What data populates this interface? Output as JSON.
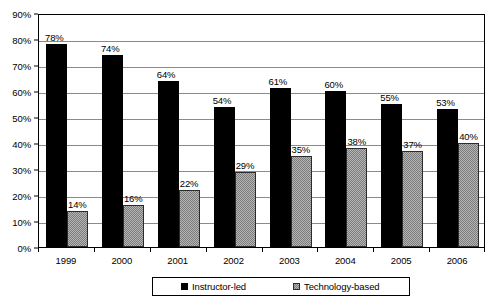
{
  "chart_data": {
    "type": "bar",
    "title": "",
    "xlabel": "",
    "ylabel": "",
    "ylim": [
      0,
      90
    ],
    "ytick_step": 10,
    "grid": true,
    "legend_position": "bottom",
    "categories": [
      "1999",
      "2000",
      "2001",
      "2002",
      "2003",
      "2004",
      "2005",
      "2006"
    ],
    "ytick_labels": [
      "0%",
      "10%",
      "20%",
      "30%",
      "40%",
      "50%",
      "60%",
      "70%",
      "80%",
      "90%"
    ],
    "series": [
      {
        "name": "Instructor-led",
        "color": "#000000",
        "values": [
          78,
          74,
          64,
          54,
          61,
          60,
          55,
          53
        ],
        "data_labels": [
          "78%",
          "74%",
          "64%",
          "54%",
          "61%",
          "60%",
          "55%",
          "53%"
        ]
      },
      {
        "name": "Technology-based",
        "color": "#b4b4b4",
        "values": [
          14,
          16,
          22,
          29,
          35,
          38,
          37,
          40
        ],
        "data_labels": [
          "14%",
          "16%",
          "22%",
          "29%",
          "35%",
          "38%",
          "37%",
          "40%"
        ]
      }
    ]
  },
  "legend": {
    "entries": [
      {
        "label": "Instructor-led",
        "swatch": "black-square-swatch"
      },
      {
        "label": "Technology-based",
        "swatch": "gray-square-swatch"
      }
    ]
  }
}
